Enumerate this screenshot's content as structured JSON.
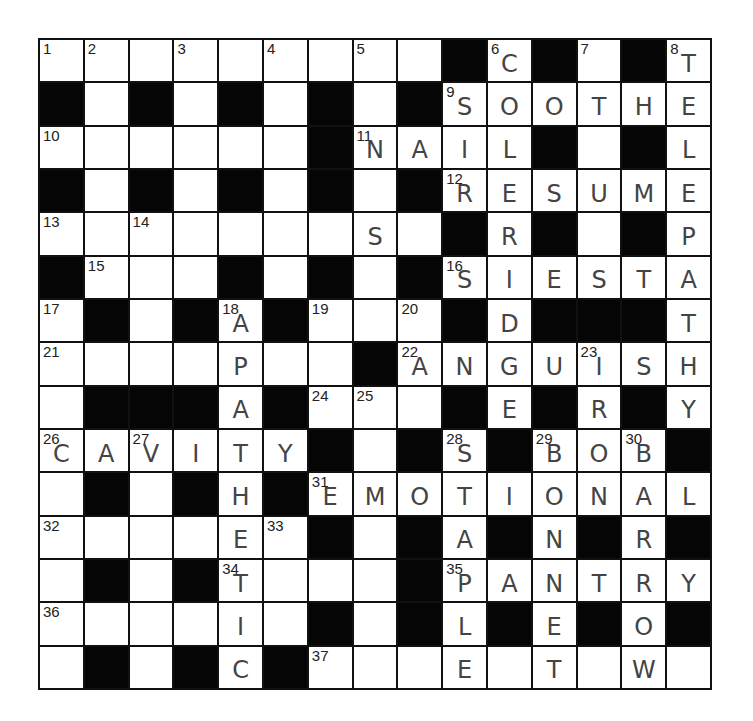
{
  "puzzle": {
    "rows": 15,
    "cols": 15,
    "colors": {
      "black_cell": "#050505",
      "white_cell": "#ffffff",
      "grid_line": "#111111",
      "handwriting": "#444444"
    },
    "grid": [
      [
        "1",
        "2",
        ".",
        "3",
        ".",
        "4",
        ".",
        "5",
        ".",
        "#",
        "6",
        "#",
        "7",
        "#",
        "8"
      ],
      [
        "#",
        ".",
        "#",
        ".",
        "#",
        ".",
        "#",
        ".",
        "#",
        "9",
        ".",
        ".",
        ".",
        ".",
        "."
      ],
      [
        "10",
        ".",
        ".",
        ".",
        ".",
        ".",
        "#",
        "11",
        ".",
        ".",
        ".",
        "#",
        ".",
        "#",
        "."
      ],
      [
        "#",
        ".",
        "#",
        ".",
        "#",
        ".",
        "#",
        ".",
        "#",
        "12",
        ".",
        ".",
        ".",
        ".",
        "."
      ],
      [
        "13",
        ".",
        "14",
        ".",
        ".",
        ".",
        ".",
        ".",
        ".",
        "#",
        ".",
        "#",
        ".",
        "#",
        "."
      ],
      [
        "#",
        "15",
        ".",
        ".",
        "#",
        ".",
        "#",
        ".",
        "#",
        "16",
        ".",
        ".",
        ".",
        ".",
        "."
      ],
      [
        "17",
        "#",
        ".",
        "#",
        "18",
        "#",
        "19",
        ".",
        "20",
        "#",
        ".",
        "#",
        "#",
        "#",
        "."
      ],
      [
        "21",
        ".",
        ".",
        ".",
        ".",
        ".",
        ".",
        "#",
        "22",
        ".",
        ".",
        ".",
        "23",
        ".",
        "."
      ],
      [
        ".",
        "#",
        "#",
        "#",
        ".",
        "#",
        "24",
        "25",
        ".",
        "#",
        ".",
        "#",
        ".",
        "#",
        "."
      ],
      [
        "26",
        ".",
        "27",
        ".",
        ".",
        ".",
        "#",
        ".",
        "#",
        "28",
        "#",
        "29",
        ".",
        "30",
        "#"
      ],
      [
        ".",
        "#",
        ".",
        "#",
        ".",
        "#",
        "31",
        ".",
        ".",
        ".",
        ".",
        ".",
        ".",
        ".",
        "."
      ],
      [
        "32",
        ".",
        ".",
        ".",
        ".",
        "33",
        "#",
        ".",
        "#",
        ".",
        "#",
        ".",
        "#",
        ".",
        "#"
      ],
      [
        ".",
        "#",
        ".",
        "#",
        "34",
        ".",
        ".",
        ".",
        "#",
        "35",
        ".",
        ".",
        ".",
        ".",
        "."
      ],
      [
        "36",
        ".",
        ".",
        ".",
        ".",
        ".",
        "#",
        ".",
        "#",
        ".",
        "#",
        ".",
        "#",
        ".",
        "#"
      ],
      [
        ".",
        "#",
        ".",
        "#",
        ".",
        "#",
        "37",
        ".",
        ".",
        ".",
        ".",
        ".",
        ".",
        ".",
        "."
      ]
    ],
    "letters": [
      [
        "",
        "",
        "",
        "",
        "",
        "",
        "",
        "",
        "",
        "",
        "C",
        "",
        "",
        "",
        "T"
      ],
      [
        "",
        "",
        "",
        "",
        "",
        "",
        "",
        "",
        "",
        "S",
        "O",
        "O",
        "T",
        "H",
        "E"
      ],
      [
        "",
        "",
        "",
        "",
        "",
        "",
        "",
        "N",
        "A",
        "I",
        "L",
        "",
        "",
        "",
        "L"
      ],
      [
        "",
        "",
        "",
        "",
        "",
        "",
        "",
        "",
        "",
        "R",
        "E",
        "S",
        "U",
        "M",
        "E"
      ],
      [
        "",
        "",
        "",
        "",
        "",
        "",
        "",
        "S",
        "",
        "",
        "R",
        "",
        "",
        "",
        "P"
      ],
      [
        "",
        "",
        "",
        "",
        "",
        "",
        "",
        "",
        "",
        "S",
        "I",
        "E",
        "S",
        "T",
        "A"
      ],
      [
        "",
        "",
        "",
        "",
        "A",
        "",
        "",
        "",
        "",
        "",
        "D",
        "",
        "",
        "",
        "T"
      ],
      [
        "",
        "",
        "",
        "",
        "P",
        "",
        "",
        "",
        "A",
        "N",
        "G",
        "U",
        "I",
        "S",
        "H"
      ],
      [
        "",
        "",
        "",
        "",
        "A",
        "",
        "",
        "",
        "",
        "",
        "E",
        "",
        "R",
        "",
        "Y"
      ],
      [
        "C",
        "A",
        "V",
        "I",
        "T",
        "Y",
        "",
        "",
        "",
        "S",
        "",
        "B",
        "O",
        "B",
        ""
      ],
      [
        "",
        "",
        "",
        "",
        "H",
        "",
        "E",
        "M",
        "O",
        "T",
        "I",
        "O",
        "N",
        "A",
        "L"
      ],
      [
        "",
        "",
        "",
        "",
        "E",
        "",
        "",
        "",
        "",
        "A",
        "",
        "N",
        "",
        "R",
        ""
      ],
      [
        "",
        "",
        "",
        "",
        "T",
        "",
        "",
        "",
        "",
        "P",
        "A",
        "N",
        "T",
        "R",
        "Y"
      ],
      [
        "",
        "",
        "",
        "",
        "I",
        "",
        "",
        "",
        "",
        "L",
        "",
        "E",
        "",
        "O",
        ""
      ],
      [
        "",
        "",
        "",
        "",
        "C",
        "",
        "",
        "",
        "",
        "E",
        "",
        "T",
        "",
        "W",
        ""
      ]
    ],
    "filled_answers": {
      "across": [
        {
          "number": "9",
          "answer": "SOOTHE"
        },
        {
          "number": "11",
          "answer": "NAIL"
        },
        {
          "number": "12",
          "answer": "RESUME"
        },
        {
          "number": "16",
          "answer": "SIESTA"
        },
        {
          "number": "22",
          "answer": "ANGUISH"
        },
        {
          "number": "26",
          "answer": "CAVITY"
        },
        {
          "number": "29",
          "answer": "BOB"
        },
        {
          "number": "31",
          "answer": "EMOTIONAL"
        },
        {
          "number": "35",
          "answer": "PANTRY"
        }
      ],
      "down": [
        {
          "number": "6",
          "answer": "COLERIDGE"
        },
        {
          "number": "8",
          "answer": "TELEPATHY"
        },
        {
          "number": "18",
          "answer": "APATHETIC"
        },
        {
          "number": "23",
          "answer": "IRON"
        },
        {
          "number": "28",
          "answer": "STAPLE"
        },
        {
          "number": "29",
          "answer": "BONNET"
        },
        {
          "number": "30",
          "answer": "BARROW"
        }
      ]
    }
  }
}
